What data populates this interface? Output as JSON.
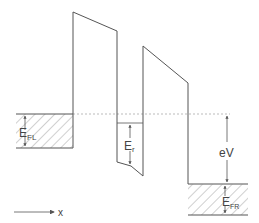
{
  "diagram": {
    "type": "energy-band-diagram",
    "labels": {
      "fermi_left": "E",
      "fermi_left_sub": "FL",
      "resonance": "E",
      "resonance_sub": "r",
      "bias": "eV",
      "fermi_right": "E",
      "fermi_right_sub": "FR",
      "axis": "x"
    },
    "colors": {
      "line": "#555555",
      "hatch": "#888888",
      "dashed": "#999999"
    }
  }
}
